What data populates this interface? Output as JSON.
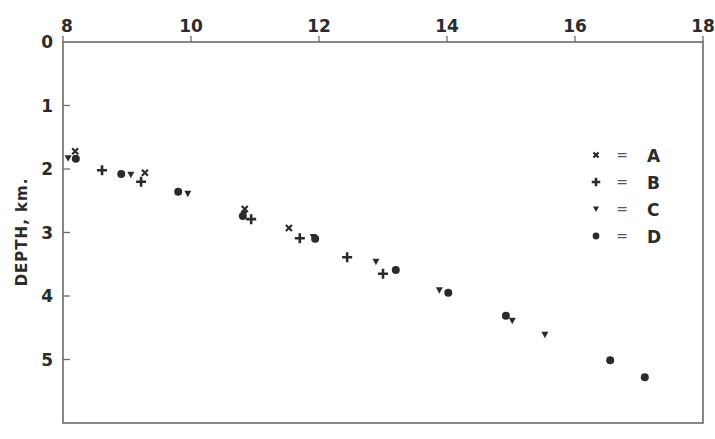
{
  "chart_data": {
    "type": "scatter",
    "title": "",
    "xlabel": "",
    "ylabel": "DEPTH, km.",
    "xlim": [
      8,
      18
    ],
    "ylim": [
      0,
      6
    ],
    "y_inverted": true,
    "x_axis_position": "top",
    "x_ticks": [
      8,
      10,
      12,
      14,
      16,
      18
    ],
    "y_ticks": [
      0,
      1,
      2,
      3,
      4,
      5
    ],
    "grid": false,
    "legend_position": "right-inside",
    "series": [
      {
        "name": "A",
        "marker": "x",
        "points": [
          [
            8.19,
            1.72
          ],
          [
            9.28,
            2.06
          ],
          [
            10.84,
            2.63
          ],
          [
            11.53,
            2.93
          ]
        ]
      },
      {
        "name": "B",
        "marker": "+",
        "points": [
          [
            8.61,
            2.02
          ],
          [
            9.22,
            2.2
          ],
          [
            10.94,
            2.79
          ],
          [
            11.7,
            3.09
          ],
          [
            12.44,
            3.39
          ],
          [
            13.0,
            3.65
          ]
        ]
      },
      {
        "name": "C",
        "marker": "triangle-down",
        "points": [
          [
            8.08,
            1.83
          ],
          [
            9.06,
            2.09
          ],
          [
            9.95,
            2.39
          ],
          [
            10.83,
            2.71
          ],
          [
            11.91,
            3.07
          ],
          [
            12.89,
            3.46
          ],
          [
            13.88,
            3.91
          ],
          [
            15.02,
            4.39
          ],
          [
            15.53,
            4.61
          ]
        ]
      },
      {
        "name": "D",
        "marker": "circle",
        "points": [
          [
            8.2,
            1.84
          ],
          [
            8.91,
            2.08
          ],
          [
            9.8,
            2.36
          ],
          [
            10.81,
            2.74
          ],
          [
            11.94,
            3.1
          ],
          [
            13.2,
            3.59
          ],
          [
            14.02,
            3.95
          ],
          [
            14.92,
            4.31
          ],
          [
            16.55,
            5.01
          ],
          [
            17.09,
            5.28
          ]
        ]
      }
    ]
  },
  "axes": {
    "x_tick_labels": [
      "8",
      "10",
      "12",
      "14",
      "16",
      "18"
    ],
    "y_tick_labels": [
      "0",
      "1",
      "2",
      "3",
      "4",
      "5"
    ],
    "y_title": "DEPTH, km."
  },
  "legend": {
    "items": [
      {
        "symbol": "x",
        "eq": "=",
        "label": "A"
      },
      {
        "symbol": "+",
        "eq": "=",
        "label": "B"
      },
      {
        "symbol": "triangle-down",
        "eq": "=",
        "label": "C"
      },
      {
        "symbol": "circle",
        "eq": "=",
        "label": "D"
      }
    ]
  },
  "colors": {
    "ink": "#2b2b2b",
    "frame": "#6b6b6b",
    "background": "#ffffff"
  }
}
